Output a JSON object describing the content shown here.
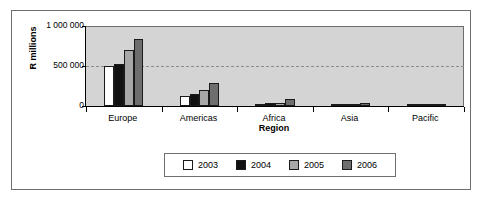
{
  "chart_data": {
    "type": "bar",
    "title": "",
    "subtitle": "",
    "xlabel": "Region",
    "ylabel": "R millions",
    "categories": [
      "Europe",
      "Americas",
      "Africa",
      "Asia",
      "Pacific"
    ],
    "series": [
      {
        "name": "2003",
        "color": "#ffffff",
        "values": [
          505000,
          130000,
          20000,
          15000,
          8000
        ]
      },
      {
        "name": "2004",
        "color": "#111111",
        "values": [
          520000,
          155000,
          42000,
          28000,
          10000
        ]
      },
      {
        "name": "2005",
        "color": "#a8a8a8",
        "values": [
          700000,
          200000,
          40000,
          26000,
          9000
        ]
      },
      {
        "name": "2006",
        "color": "#6e6e6e",
        "values": [
          840000,
          285000,
          90000,
          40000,
          12000
        ]
      }
    ],
    "ylim": [
      0,
      1000000
    ],
    "yticks": [
      0,
      500000,
      1000000
    ],
    "ytick_labels": [
      "0",
      "500 000",
      "1 000 000"
    ],
    "grid": true,
    "gridlines_at": [
      500000
    ],
    "legend_position": "bottom",
    "plot_background": "#d4d4d4",
    "axis_color": "#000000"
  }
}
